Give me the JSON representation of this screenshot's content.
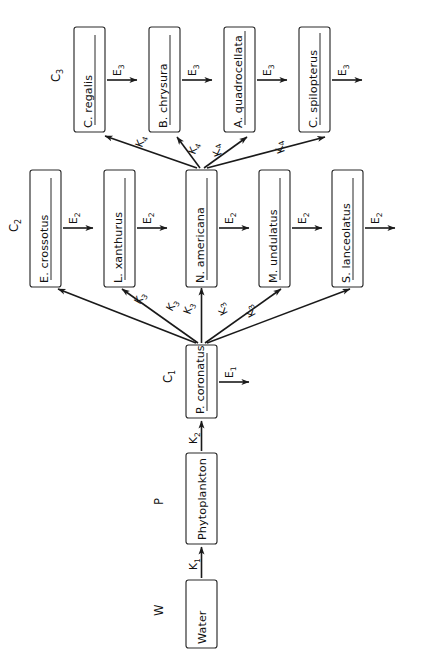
{
  "diagram": {
    "orientation_degrees": -90,
    "colors": {
      "stroke": "#1a1a1a",
      "box_fill": "#ffffff",
      "background": "#ffffff"
    },
    "groups": [
      {
        "id": "W",
        "label": "W",
        "sub": ""
      },
      {
        "id": "P",
        "label": "P",
        "sub": ""
      },
      {
        "id": "C1",
        "label": "C",
        "sub": "1"
      },
      {
        "id": "C2",
        "label": "C",
        "sub": "2"
      },
      {
        "id": "C3",
        "label": "C",
        "sub": "3"
      }
    ],
    "boxes": [
      {
        "id": "water",
        "label": "Water",
        "group": "W",
        "underline": false
      },
      {
        "id": "phytoplankton",
        "label": "Phytoplankton",
        "group": "P",
        "underline": false
      },
      {
        "id": "p_coronatus",
        "label": "P. coronatus",
        "group": "C1",
        "underline": true
      },
      {
        "id": "e_crossotus",
        "label": "E. crossotus",
        "group": "C2",
        "underline": true
      },
      {
        "id": "l_xanthurus",
        "label": "L. xanthurus",
        "group": "C2",
        "underline": true
      },
      {
        "id": "n_americana",
        "label": "N. americana",
        "group": "C2",
        "underline": true
      },
      {
        "id": "m_undulatus",
        "label": "M. undulatus",
        "group": "C2",
        "underline": true
      },
      {
        "id": "s_lanceolatus",
        "label": "S. lanceolatus",
        "group": "C2",
        "underline": true
      },
      {
        "id": "c_regalis",
        "label": "C. regalis",
        "group": "C3",
        "underline": true
      },
      {
        "id": "b_chrysura",
        "label": "B. chrysura",
        "group": "C3",
        "underline": true
      },
      {
        "id": "a_quadrocellata",
        "label": "A. quadrocellata",
        "group": "C3",
        "underline": true
      },
      {
        "id": "c_spilopterus",
        "label": "C. spilopterus",
        "group": "C3",
        "underline": true
      }
    ],
    "transfer_labels": [
      {
        "id": "k1",
        "label": "K",
        "sub": "1",
        "from": "water",
        "to": "phytoplankton"
      },
      {
        "id": "k2",
        "label": "K",
        "sub": "2",
        "from": "phytoplankton",
        "to": "p_coronatus"
      },
      {
        "id": "k3a",
        "label": "K",
        "sub": "3",
        "from": "p_coronatus",
        "to": "e_crossotus"
      },
      {
        "id": "k3b",
        "label": "K",
        "sub": "3",
        "from": "p_coronatus",
        "to": "l_xanthurus"
      },
      {
        "id": "k3c",
        "label": "K",
        "sub": "3",
        "from": "p_coronatus",
        "to": "n_americana"
      },
      {
        "id": "k3d",
        "label": "K",
        "sub": "3",
        "from": "p_coronatus",
        "to": "m_undulatus"
      },
      {
        "id": "k3e",
        "label": "K",
        "sub": "3",
        "from": "p_coronatus",
        "to": "s_lanceolatus"
      },
      {
        "id": "k4a",
        "label": "K",
        "sub": "4",
        "from": "n_americana",
        "to": "c_regalis"
      },
      {
        "id": "k4b",
        "label": "K",
        "sub": "4",
        "from": "n_americana",
        "to": "b_chrysura"
      },
      {
        "id": "k4c",
        "label": "K",
        "sub": "4",
        "from": "n_americana",
        "to": "a_quadrocellata"
      },
      {
        "id": "k4d",
        "label": "K",
        "sub": "4",
        "from": "n_americana",
        "to": "c_spilopterus"
      }
    ],
    "egestion_labels": [
      {
        "id": "e1",
        "label": "E",
        "sub": "1",
        "from": "p_coronatus"
      },
      {
        "id": "e2a",
        "label": "E",
        "sub": "2",
        "from": "e_crossotus"
      },
      {
        "id": "e2b",
        "label": "E",
        "sub": "2",
        "from": "l_xanthurus"
      },
      {
        "id": "e2c",
        "label": "E",
        "sub": "2",
        "from": "n_americana"
      },
      {
        "id": "e2d",
        "label": "E",
        "sub": "2",
        "from": "m_undulatus"
      },
      {
        "id": "e2e",
        "label": "E",
        "sub": "2",
        "from": "s_lanceolatus"
      },
      {
        "id": "e3a",
        "label": "E",
        "sub": "3",
        "from": "c_regalis"
      },
      {
        "id": "e3b",
        "label": "E",
        "sub": "3",
        "from": "b_chrysura"
      },
      {
        "id": "e3c",
        "label": "E",
        "sub": "3",
        "from": "a_quadrocellata"
      },
      {
        "id": "e3d",
        "label": "E",
        "sub": "3",
        "from": "c_spilopterus"
      }
    ]
  }
}
